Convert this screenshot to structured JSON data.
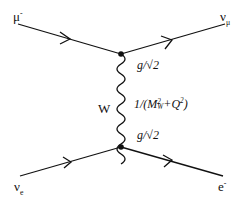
{
  "diagram": {
    "type": "feynman",
    "particles": {
      "top_left": {
        "symbol": "μ",
        "sup": "-"
      },
      "top_right": {
        "symbol": "ν",
        "sub": "μ"
      },
      "bottom_left": {
        "symbol": "ν",
        "sub": "e"
      },
      "bottom_right": {
        "symbol": "e",
        "sup": "-"
      }
    },
    "boson": {
      "label": "W"
    },
    "vertex_top": {
      "coupling": "g/√2"
    },
    "vertex_bottom": {
      "coupling": "g/√2"
    },
    "propagator": {
      "prefix": "1/(M",
      "sup": "2",
      "sub": "W",
      "middle": "+Q",
      "sup2": "2",
      "suffix": ")"
    },
    "colors": {
      "line": "#111111",
      "background": "#ffffff"
    }
  }
}
